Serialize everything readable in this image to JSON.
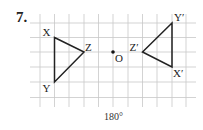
{
  "problem_number": "7.",
  "caption": "180°",
  "grid": {
    "x_lines": [
      40,
      54.5,
      69,
      84,
      98.5,
      113,
      128,
      142.5,
      157,
      172,
      186
    ],
    "y_lines": [
      23,
      37.5,
      52,
      67,
      82,
      97.5
    ],
    "x_start": 30,
    "x_end": 196,
    "y_start": 14,
    "y_end": 107,
    "color": "#c8c8c8"
  },
  "original_triangle": {
    "X": {
      "label": "X",
      "x": 54.5,
      "y": 37.5
    },
    "Y": {
      "label": "Y",
      "x": 54.5,
      "y": 82
    },
    "Z": {
      "label": "Z",
      "x": 84,
      "y": 52
    }
  },
  "image_triangle": {
    "X'": {
      "label": "X′",
      "x": 172,
      "y": 67
    },
    "Y'": {
      "label": "Y′",
      "x": 172,
      "y": 23
    },
    "Z'": {
      "label": "Z′",
      "x": 142.5,
      "y": 52
    }
  },
  "center": {
    "label": "O",
    "x": 113,
    "y": 52
  },
  "transformation": "rotation 180° about O"
}
